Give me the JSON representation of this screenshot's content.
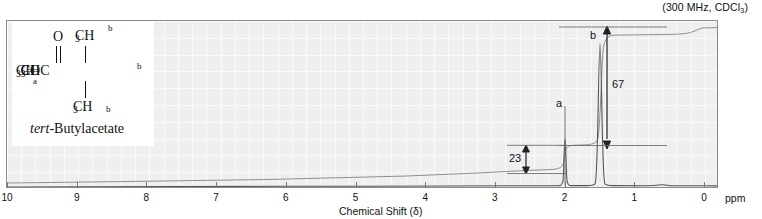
{
  "header": {
    "conditions_prefix": "(300 MHz, CDCl",
    "conditions_sub": "3",
    "conditions_suffix": ")",
    "conditions_full": "(300 MHz, CDCl3)"
  },
  "structure": {
    "carbonyl_oxygen": "O",
    "methyl_top": "CH",
    "methyl_top_sub": "3",
    "label_b_top": "b",
    "backbone": "CH",
    "backbone_sub1": "3",
    "backbone_mid": "COC",
    "backbone_right": "CH",
    "backbone_right_sub": "3",
    "label_a": "a",
    "label_b_right": "b",
    "methyl_bottom": "CH",
    "methyl_bottom_sub": "3",
    "label_b_bottom": "b",
    "compound_prefix": "tert",
    "compound_name": "-Butylacetate"
  },
  "axis": {
    "title": "Chemical Shift (δ)",
    "unit_label": "ppm",
    "ticks": [
      "10",
      "9",
      "8",
      "7",
      "6",
      "5",
      "4",
      "3",
      "2",
      "1",
      "0"
    ],
    "min_ppm": 0,
    "max_ppm": 10
  },
  "annotations": {
    "peak_a_label": "a",
    "peak_b_label": "b",
    "integral_a_value": "23",
    "integral_b_value": "67"
  },
  "colors": {
    "plot_background": "#efeff0",
    "frame_border": "#8b8b8b",
    "trace": "#4a4a4a",
    "integral": "#8a8a8a",
    "annotation": "#222222",
    "page_background": "#ffffff"
  },
  "chart_data": {
    "type": "line",
    "subtitle": "(300 MHz, CDCl3)",
    "xlabel": "Chemical Shift (δ)",
    "ylabel": "",
    "xlim": [
      10,
      0
    ],
    "x_unit": "ppm",
    "x_reversed": true,
    "grid": true,
    "legend": null,
    "tick_labels": [
      "10",
      "9",
      "8",
      "7",
      "6",
      "5",
      "4",
      "3",
      "2",
      "1",
      "0"
    ],
    "peaks": [
      {
        "id": "a",
        "shift_ppm": 1.95,
        "relative_height": 0.34,
        "multiplicity": "singlet",
        "assignment": "CH3 (acetyl)",
        "protons": 3,
        "integral_units": 23
      },
      {
        "id": "b",
        "shift_ppm": 1.44,
        "relative_height": 1.0,
        "multiplicity": "singlet",
        "assignment": "C(CH3)3 (tert-butyl)",
        "protons": 9,
        "integral_units": 67
      }
    ],
    "integration_steps": [
      {
        "id": "a",
        "value": 23,
        "shift_ppm": 1.95
      },
      {
        "id": "b",
        "value": 67,
        "shift_ppm": 1.44
      }
    ],
    "annotations": [
      {
        "text": "a",
        "shift_ppm": 2.03,
        "type": "peak-label"
      },
      {
        "text": "b",
        "shift_ppm": 1.58,
        "type": "peak-label"
      },
      {
        "text": "23",
        "shift_ppm": 2.25,
        "type": "integral-value"
      },
      {
        "text": "67",
        "shift_ppm": 1.43,
        "type": "integral-value"
      }
    ]
  }
}
